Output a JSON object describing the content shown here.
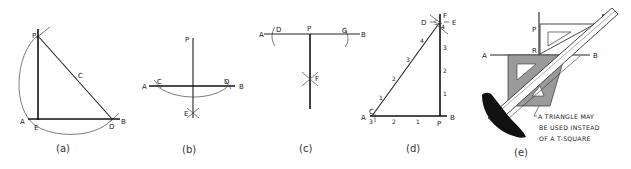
{
  "figures": [
    {
      "id": "a",
      "caption": "(a)",
      "labels": {
        "P": "P",
        "C": "C",
        "A": "A",
        "E": "E",
        "D": "D",
        "B": "B"
      }
    },
    {
      "id": "b",
      "caption": "(b)",
      "labels": {
        "P": "P",
        "A": "A",
        "C": "C",
        "D": "D",
        "B": "B",
        "E": "E"
      }
    },
    {
      "id": "c",
      "caption": "(c)",
      "labels": {
        "A": "A",
        "D": "D",
        "P": "P",
        "G": "G",
        "B": "B",
        "F": "F"
      }
    },
    {
      "id": "d",
      "caption": "(d)",
      "labels": {
        "D": "D",
        "S": "S",
        "F": "F",
        "E": "E",
        "A": "A",
        "C": "C",
        "B": "B",
        "P": "P"
      },
      "hypotenuse_ticks": [
        "1",
        "2",
        "3",
        "4"
      ],
      "vertical_ticks": [
        "1",
        "2",
        "3",
        "4"
      ],
      "base_ticks": [
        "3",
        "2",
        "1"
      ]
    },
    {
      "id": "e",
      "caption": "(e)",
      "labels": {
        "P": "P",
        "R": "R",
        "A": "A",
        "B": "B"
      },
      "note_lines": [
        "A TRIANGLE MAY",
        "BE USED INSTEAD",
        "OF A T-SQUARE"
      ]
    }
  ],
  "colors": {
    "line": "#222222",
    "triangle_fill": "#9a9a9a",
    "tsquare_head": "#111111",
    "background": "#ffffff"
  }
}
